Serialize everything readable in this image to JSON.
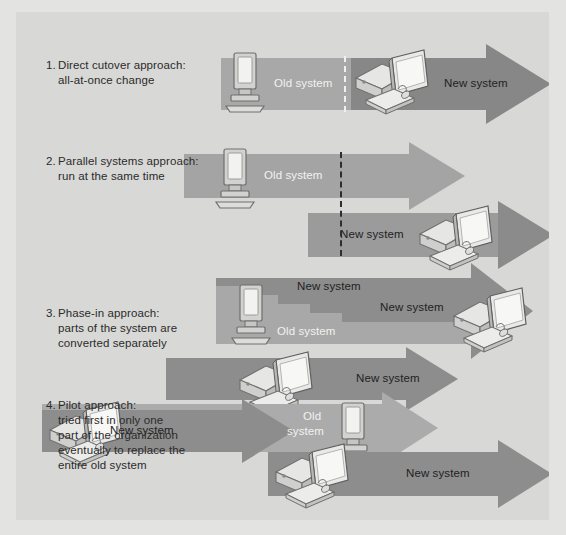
{
  "figure": {
    "background_color": "#e3e3e1",
    "panel_color": "#d8d8d6",
    "arrow_light_color": "#a8a8a8",
    "arrow_dark_color": "#878787",
    "arrow_mid_color": "#9a9a9a",
    "label_text_color": "#2b2b2b",
    "arrow_text_light": "#f2f2f0",
    "arrow_text_dark": "#222222"
  },
  "approaches": [
    {
      "number": "1.",
      "title": "Direct cutover approach:",
      "detail": "all-at-once change",
      "labels": {
        "old": "Old system",
        "new": "New system"
      },
      "icons": [
        "old-terminal",
        "new-desktop"
      ],
      "divider": "dashed-vertical-white"
    },
    {
      "number": "2.",
      "title": "Parallel systems approach:",
      "detail": "run at the same time",
      "labels": {
        "old": "Old system",
        "new": "New system"
      },
      "icons": [
        "old-terminal",
        "new-desktop"
      ],
      "divider": "dashed-vertical-black"
    },
    {
      "number": "3.",
      "title": "Phase-in approach:",
      "detail_line1": "parts of the system are",
      "detail_line2": "converted separately",
      "labels": {
        "old": "Old system",
        "new_top": "New system",
        "new_inner": "New system"
      },
      "icons": [
        "old-terminal",
        "new-desktop"
      ],
      "pattern": "staircase"
    },
    {
      "number": "4.",
      "title": "Pilot approach:",
      "detail_line1": "tried first in only one",
      "detail_line2": "part of the organization",
      "detail_line3": "eventually to replace the",
      "detail_line4": "entire old system",
      "labels": {
        "new_top": "New system",
        "new_mid": "New system",
        "new_bottom": "New system",
        "old_line1": "Old",
        "old_line2": "system"
      },
      "icons": [
        "new-desktop",
        "new-desktop",
        "old-terminal",
        "new-desktop"
      ]
    }
  ]
}
